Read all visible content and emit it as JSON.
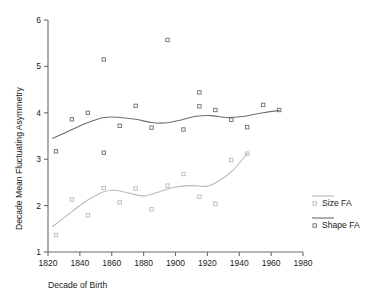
{
  "chart_data": {
    "type": "scatter",
    "title": "",
    "xlabel": "Decade of Birth",
    "ylabel": "Decade Mean Fluctuating Asymmetry",
    "xlim": [
      1820,
      1980
    ],
    "ylim": [
      1,
      6
    ],
    "xticks": [
      1820,
      1840,
      1860,
      1880,
      1900,
      1920,
      1940,
      1960,
      1980
    ],
    "yticks": [
      1,
      2,
      3,
      4,
      5,
      6
    ],
    "grid": false,
    "legend_position": "right",
    "series": [
      {
        "name": "Size FA",
        "color": "#b9b9b9",
        "marker": "open-square",
        "points": [
          {
            "x": 1825,
            "y": 1.37
          },
          {
            "x": 1835,
            "y": 2.13
          },
          {
            "x": 1845,
            "y": 1.79
          },
          {
            "x": 1855,
            "y": 2.38
          },
          {
            "x": 1865,
            "y": 2.07
          },
          {
            "x": 1875,
            "y": 2.37
          },
          {
            "x": 1885,
            "y": 1.92
          },
          {
            "x": 1895,
            "y": 2.43
          },
          {
            "x": 1905,
            "y": 2.68
          },
          {
            "x": 1915,
            "y": 2.19
          },
          {
            "x": 1925,
            "y": 2.04
          },
          {
            "x": 1935,
            "y": 2.98
          },
          {
            "x": 1945,
            "y": 3.12
          }
        ],
        "fit_line": [
          {
            "x": 1823,
            "y": 1.55
          },
          {
            "x": 1835,
            "y": 1.87
          },
          {
            "x": 1845,
            "y": 2.12
          },
          {
            "x": 1855,
            "y": 2.3
          },
          {
            "x": 1862,
            "y": 2.33
          },
          {
            "x": 1872,
            "y": 2.26
          },
          {
            "x": 1880,
            "y": 2.21
          },
          {
            "x": 1890,
            "y": 2.3
          },
          {
            "x": 1900,
            "y": 2.4
          },
          {
            "x": 1910,
            "y": 2.43
          },
          {
            "x": 1920,
            "y": 2.42
          },
          {
            "x": 1928,
            "y": 2.55
          },
          {
            "x": 1936,
            "y": 2.76
          },
          {
            "x": 1945,
            "y": 3.12
          }
        ]
      },
      {
        "name": "Shape FA",
        "color": "#6e6e6e",
        "marker": "open-square",
        "points": [
          {
            "x": 1825,
            "y": 3.17
          },
          {
            "x": 1835,
            "y": 3.86
          },
          {
            "x": 1845,
            "y": 4.0
          },
          {
            "x": 1855,
            "y": 5.15
          },
          {
            "x": 1855,
            "y": 3.14
          },
          {
            "x": 1865,
            "y": 3.72
          },
          {
            "x": 1875,
            "y": 4.15
          },
          {
            "x": 1885,
            "y": 3.68
          },
          {
            "x": 1895,
            "y": 5.57
          },
          {
            "x": 1905,
            "y": 3.64
          },
          {
            "x": 1915,
            "y": 4.44
          },
          {
            "x": 1915,
            "y": 4.14
          },
          {
            "x": 1925,
            "y": 4.06
          },
          {
            "x": 1935,
            "y": 3.85
          },
          {
            "x": 1945,
            "y": 3.69
          },
          {
            "x": 1955,
            "y": 4.17
          },
          {
            "x": 1965,
            "y": 4.06
          }
        ],
        "fit_line": [
          {
            "x": 1823,
            "y": 3.45
          },
          {
            "x": 1835,
            "y": 3.64
          },
          {
            "x": 1845,
            "y": 3.79
          },
          {
            "x": 1855,
            "y": 3.9
          },
          {
            "x": 1865,
            "y": 3.9
          },
          {
            "x": 1875,
            "y": 3.86
          },
          {
            "x": 1885,
            "y": 3.79
          },
          {
            "x": 1893,
            "y": 3.78
          },
          {
            "x": 1903,
            "y": 3.84
          },
          {
            "x": 1912,
            "y": 3.92
          },
          {
            "x": 1922,
            "y": 3.94
          },
          {
            "x": 1932,
            "y": 3.9
          },
          {
            "x": 1942,
            "y": 3.92
          },
          {
            "x": 1955,
            "y": 4.0
          },
          {
            "x": 1965,
            "y": 4.05
          }
        ]
      }
    ]
  },
  "legend": {
    "entries": [
      {
        "label": "Size FA",
        "color": "#b9b9b9"
      },
      {
        "label": "Shape FA",
        "color": "#6e6e6e"
      }
    ]
  },
  "axis": {
    "x_title": "Decade of Birth",
    "y_title": "Decade Mean Fluctuating Asymmetry",
    "x_tick_labels": [
      "1820",
      "1840",
      "1860",
      "1880",
      "1900",
      "1920",
      "1940",
      "1960",
      "1980"
    ],
    "y_tick_labels": [
      "1",
      "2",
      "3",
      "4",
      "5",
      "6"
    ]
  }
}
